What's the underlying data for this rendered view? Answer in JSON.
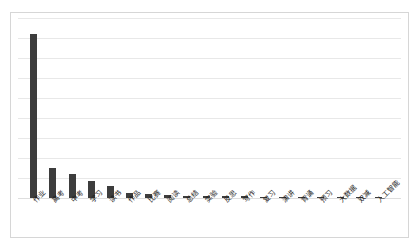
{
  "chart_data": {
    "type": "bar",
    "title": "",
    "subtitle": "",
    "xlabel": "",
    "ylabel": "",
    "legend": [],
    "legend_position": "none",
    "grid": true,
    "y_tick_labels": [],
    "ylim": [
      0,
      900
    ],
    "gridline_count": 9,
    "bar_color": "#3d3d3d",
    "gridline_color": "#e8e8e8",
    "categories": [
      "作业",
      "高考",
      "中考",
      "学习",
      "读书",
      "作品",
      "比赛",
      "阅读",
      "总结",
      "实验",
      "反思",
      "写作",
      "复习",
      "演讲",
      "背诵",
      "预习",
      "大数据",
      "双减",
      "人工智能"
    ],
    "values": [
      820,
      148,
      118,
      86,
      62,
      24,
      18,
      13,
      11,
      10,
      9,
      8,
      7,
      7,
      6,
      5,
      4,
      3,
      2
    ]
  },
  "frame": {
    "border_color": "#d6d6d6"
  }
}
